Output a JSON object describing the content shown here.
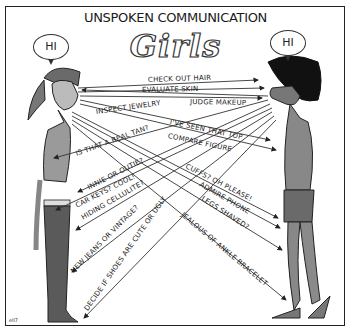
{
  "comic": {
    "title": "UNSPOKEN COMMUNICATION",
    "subtitle": "Girls",
    "signature": "ell7",
    "left_character": {
      "speech": "HI"
    },
    "right_character": {
      "speech": "HI"
    },
    "glances_left_to_right": [
      "CHECK OUT HAIR",
      "EVALUATE SKIN",
      "JUDGE MAKEUP",
      "I'VE SEEN THAT TOP",
      "COMPARE FIGURE",
      "CUFFS? OH PLEASE!",
      "ADMIRE PHONE",
      "LEGS SHAVED?",
      "JEALOUS OF ANKLE BRACELET"
    ],
    "glances_right_to_left": [
      "INSPECT JEWELRY",
      "IS THAT A REAL TAN?",
      "INNIE OR OUTIE?",
      "CAR KEYS? COOL!",
      "HIDING CELLULITE?",
      "NEW JEANS OR VINTAGE?",
      "DECIDE IF SHOES ARE CUTE OR UGLY"
    ]
  }
}
